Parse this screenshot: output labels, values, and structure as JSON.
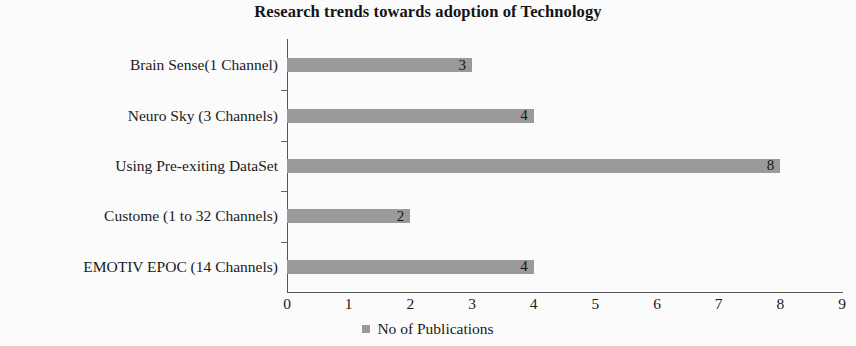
{
  "chart_data": {
    "type": "bar",
    "orientation": "horizontal",
    "title": "Research trends towards adoption of Technology",
    "xlabel": "",
    "ylabel": "",
    "categories": [
      "Brain Sense(1 Channel)",
      "Neuro Sky (3 Channels)",
      "Using Pre-exiting DataSet",
      "Custome (1 to 32 Channels)",
      "EMOTIV EPOC (14 Channels)"
    ],
    "values": [
      3,
      4,
      8,
      2,
      4
    ],
    "series": [
      {
        "name": "No of Publications",
        "values": [
          3,
          4,
          8,
          2,
          4
        ],
        "color": "#9a9a9a"
      }
    ],
    "xlim": [
      0,
      9
    ],
    "xticks": [
      "0",
      "1",
      "2",
      "3",
      "4",
      "5",
      "6",
      "7",
      "8",
      "9"
    ],
    "grid": false,
    "legend": {
      "position": "bottom",
      "entries": [
        {
          "label": "No of Publications",
          "color": "#9a9a9a"
        }
      ]
    },
    "data_labels": [
      "3",
      "4",
      "8",
      "2",
      "4"
    ],
    "data_label_position": "inside-end",
    "bar_color": "#9a9a9a",
    "axis_color": "#555555",
    "background_color": "#fbfbfb",
    "text_color": "#1a1a1a"
  }
}
